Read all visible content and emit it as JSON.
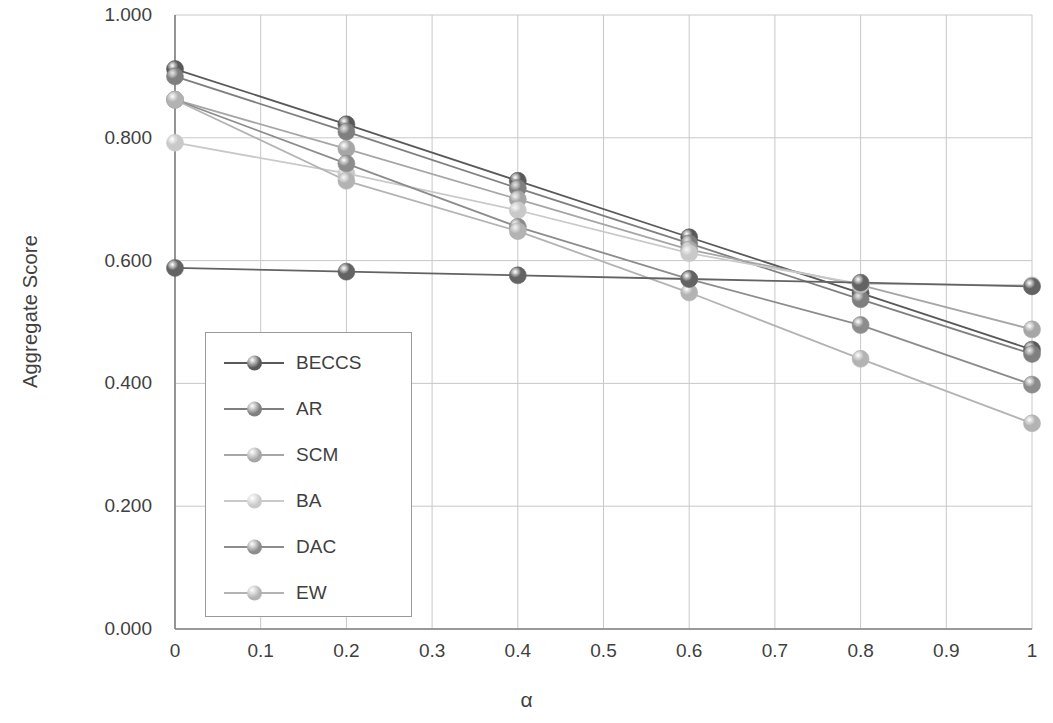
{
  "chart_data": {
    "type": "line",
    "title": "",
    "xlabel": "α",
    "ylabel": "Aggregate Score",
    "xlim": [
      0,
      1
    ],
    "ylim": [
      0,
      1
    ],
    "grid": true,
    "legend_position": "inside-left",
    "x": [
      0,
      0.2,
      0.4,
      0.6,
      0.8,
      1
    ],
    "xticks": [
      "0",
      "0.1",
      "0.2",
      "0.3",
      "0.4",
      "0.5",
      "0.6",
      "0.7",
      "0.8",
      "0.9",
      "1"
    ],
    "xtick_values": [
      0,
      0.1,
      0.2,
      0.3,
      0.4,
      0.5,
      0.6,
      0.7,
      0.8,
      0.9,
      1
    ],
    "yticks": [
      "0.000",
      "0.200",
      "0.400",
      "0.600",
      "0.800",
      "1.000"
    ],
    "ytick_values": [
      0,
      0.2,
      0.4,
      0.6,
      0.8,
      1
    ],
    "series": [
      {
        "name": "BECCS",
        "color": "#595959",
        "values": [
          0.912,
          0.822,
          0.73,
          0.638,
          0.547,
          0.455
        ]
      },
      {
        "name": "AR",
        "color": "#7f7f7f",
        "values": [
          0.9,
          0.81,
          0.718,
          0.628,
          0.537,
          0.448
        ]
      },
      {
        "name": "SCM",
        "color": "#a6a6a6",
        "values": [
          0.862,
          0.782,
          0.7,
          0.618,
          0.56,
          0.488
        ]
      },
      {
        "name": "BA",
        "color": "#c9c9c9",
        "values": [
          0.792,
          0.742,
          0.682,
          0.612,
          0.562,
          0.56
        ]
      },
      {
        "name": "DAC",
        "color": "#8c8c8c",
        "values": [
          0.862,
          0.758,
          0.655,
          0.57,
          0.495,
          0.398
        ]
      },
      {
        "name": "EW",
        "color": "#b3b3b3",
        "values": [
          0.862,
          0.73,
          0.648,
          0.548,
          0.44,
          0.335
        ]
      },
      {
        "name": "FLAT",
        "color": "#636363",
        "values": [
          0.588,
          0.582,
          0.576,
          0.57,
          0.564,
          0.558
        ]
      }
    ],
    "legend_entries": [
      "BECCS",
      "AR",
      "SCM",
      "BA",
      "DAC",
      "EW"
    ]
  },
  "axes": {
    "plot_left": 175,
    "plot_right": 1032,
    "plot_top": 15,
    "plot_bottom": 629
  }
}
